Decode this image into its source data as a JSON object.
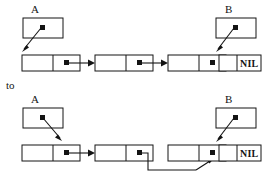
{
  "figure": {
    "type": "linked-list-pointer-diagram",
    "caption_between": "to",
    "colors": {
      "background": "#ffffff",
      "stroke": "#141414",
      "node_fill": "#ffffff",
      "dot": "#141414",
      "text": "#141414"
    },
    "diagrams": [
      {
        "id": "before",
        "pointer_vars": [
          {
            "name": "A",
            "label": "A",
            "target": "node-1",
            "arrow_direction": "down-left"
          },
          {
            "name": "B",
            "label": "B",
            "target": "node-4",
            "arrow_direction": "down-left"
          }
        ],
        "nodes": [
          {
            "id": "node-1",
            "data_cell": "",
            "next_cell": "pointer-dot",
            "next": "node-2"
          },
          {
            "id": "node-2",
            "data_cell": "",
            "next_cell": "pointer-dot",
            "next": "node-3"
          },
          {
            "id": "node-3",
            "data_cell": "",
            "next_cell": "pointer-dot",
            "next": "node-4"
          },
          {
            "id": "node-4",
            "data_cell": "",
            "next_cell": "NIL",
            "next": null
          }
        ]
      },
      {
        "id": "after",
        "pointer_vars": [
          {
            "name": "A",
            "label": "A",
            "target": "node-1",
            "arrow_direction": "down-right"
          },
          {
            "name": "B",
            "label": "B",
            "target": "node-4",
            "arrow_direction": "down-left"
          }
        ],
        "nodes": [
          {
            "id": "node-1",
            "data_cell": "",
            "next_cell": "pointer-dot",
            "next": "node-2"
          },
          {
            "id": "node-2",
            "data_cell": "",
            "next_cell": "pointer-dot",
            "next": "node-4"
          },
          {
            "id": "node-3",
            "data_cell": "",
            "next_cell": "pointer-dot",
            "next": "node-4"
          },
          {
            "id": "node-4",
            "data_cell": "",
            "next_cell": "NIL",
            "next": null
          }
        ],
        "rerouted_edge": {
          "from": "node-2",
          "to": "node-4",
          "routing": "down-around-below",
          "skips": "node-3"
        }
      }
    ],
    "labels": {
      "a_top": "A",
      "b_top": "B",
      "nil_top": "NIL",
      "to": "to",
      "a_bottom": "A",
      "b_bottom": "B",
      "nil_bottom": "NIL"
    }
  }
}
